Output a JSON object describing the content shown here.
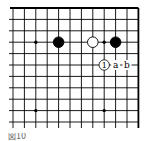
{
  "diagram": {
    "type": "go-board-fragment",
    "caption": "図10",
    "colors": {
      "line": "#000000",
      "black_stone": "#000000",
      "white_stone": "#ffffff",
      "background": "#ffffff"
    },
    "columns": 11,
    "rows": 11,
    "edges": [
      "top",
      "right"
    ],
    "star_points": [
      {
        "col": 2,
        "row": 3
      },
      {
        "col": 8,
        "row": 3
      },
      {
        "col": 2,
        "row": 9
      },
      {
        "col": 8,
        "row": 9
      }
    ],
    "stones": [
      {
        "color": "black",
        "col": 4,
        "row": 3
      },
      {
        "color": "white",
        "col": 7,
        "row": 3
      },
      {
        "color": "black",
        "col": 9,
        "row": 3
      }
    ],
    "labels": [
      {
        "text": "1",
        "kind": "move-number",
        "col": 8,
        "row": 5
      },
      {
        "text": "a",
        "kind": "letter",
        "col": 9,
        "row": 5
      },
      {
        "text": "b",
        "kind": "letter",
        "col": 10,
        "row": 5
      }
    ]
  }
}
